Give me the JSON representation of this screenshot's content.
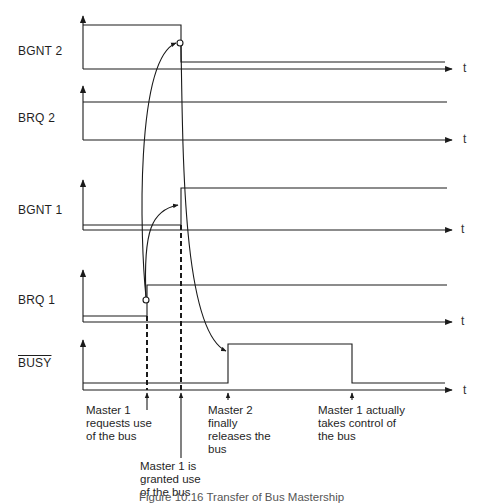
{
  "signals": [
    {
      "id": "bgnt2",
      "label": "BGNT 2",
      "overline": false
    },
    {
      "id": "brq2",
      "label": "BRQ 2",
      "overline": false
    },
    {
      "id": "bgnt1",
      "label": "BGNT 1",
      "overline": false
    },
    {
      "id": "brq1",
      "label": "BRQ 1",
      "overline": false
    },
    {
      "id": "busy",
      "label": "BUSY",
      "overline": true
    }
  ],
  "axis_label": "t",
  "annotations": [
    {
      "id": "m1-request",
      "text": "Master 1\nrequests use\nof the bus"
    },
    {
      "id": "m1-granted",
      "text": "Master 1 is\ngranted use\nof the bus"
    },
    {
      "id": "m2-release",
      "text": "Master 2\nfinally\nreleases the\nbus"
    },
    {
      "id": "m1-control",
      "text": "Master 1 actually\ntakes control of\nthe bus"
    }
  ],
  "caption": "Figure 10.16  Transfer of Bus Mastership",
  "colors": {
    "line": "#1a1a1a",
    "background": "#ffffff"
  }
}
